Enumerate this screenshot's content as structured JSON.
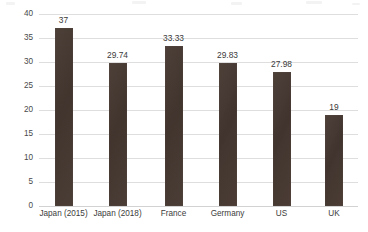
{
  "chart_data": {
    "type": "bar",
    "title": "",
    "subtitle": "",
    "xlabel": "",
    "ylabel": "Corporate effective tax rate (%)",
    "categories": [
      "Japan (2015)",
      "Japan (2018)",
      "France",
      "Germany",
      "US",
      "UK"
    ],
    "values": [
      37,
      29.74,
      33.33,
      29.83,
      27.98,
      19
    ],
    "value_labels": [
      "37",
      "29.74",
      "33.33",
      "29.83",
      "27.98",
      "19"
    ],
    "ylim": [
      0,
      40
    ],
    "yticks": [
      0,
      5,
      10,
      15,
      20,
      25,
      30,
      35,
      40
    ],
    "ytick_labels": [
      "0",
      "5",
      "10",
      "15",
      "20",
      "25",
      "30",
      "35",
      "40"
    ],
    "grid": true,
    "grid_axis": "y",
    "legend": false,
    "legend_position": "none",
    "series": [
      {
        "name": "Corporate effective tax rate",
        "values": [
          37,
          29.74,
          33.33,
          29.83,
          27.98,
          19
        ]
      }
    ],
    "colors": {
      "bar": "#453730",
      "gridline": "#dedede",
      "text": "#3a3a3a",
      "background": "#ffffff"
    }
  }
}
